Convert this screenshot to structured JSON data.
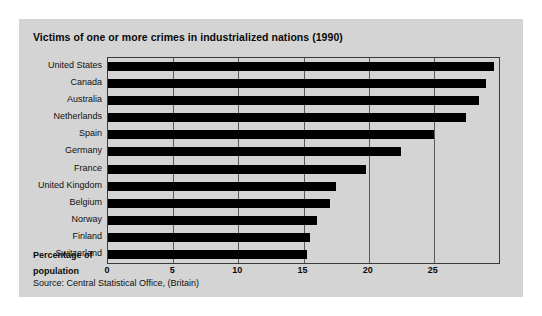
{
  "figure": {
    "title": "Victims of one or more crimes in industrialized nations (1990)",
    "axis_title_line1": "Percentage of",
    "axis_title_line2": "population",
    "source": "Source: Central Statistical Office, (Britain)",
    "background_color": "#d4d4d4",
    "bar_color": "#000000",
    "grid_color": "#5a5a5a"
  },
  "chart_data": {
    "type": "bar",
    "orientation": "horizontal",
    "title": "Victims of one or more crimes in industrialized nations (1990)",
    "xlabel": "Percentage of population",
    "ylabel": "",
    "xlim": [
      0,
      30
    ],
    "xticks": [
      0,
      5,
      10,
      15,
      20,
      25
    ],
    "xtick_labels": [
      "0",
      "5",
      "10",
      "15",
      "20",
      "25"
    ],
    "grid": true,
    "legend": false,
    "categories": [
      "United States",
      "Canada",
      "Australia",
      "Netherlands",
      "Spain",
      "Germany",
      "France",
      "United Kingdom",
      "Belgium",
      "Norway",
      "Finland",
      "Switzerland"
    ],
    "values": [
      29.6,
      29.0,
      28.5,
      27.5,
      25.0,
      22.5,
      19.8,
      17.5,
      17.0,
      16.0,
      15.5,
      15.3
    ],
    "annotations": [
      "Source: Central Statistical Office, (Britain)"
    ]
  }
}
